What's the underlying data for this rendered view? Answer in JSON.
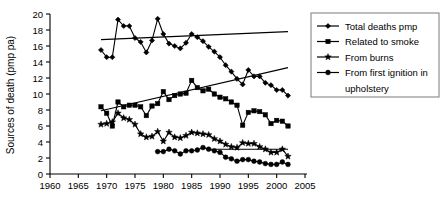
{
  "chart_data": {
    "type": "line",
    "title": "",
    "xlabel": "",
    "ylabel": "Sources of death (pmp pa)",
    "xlim": [
      1960,
      2005
    ],
    "ylim": [
      0,
      20
    ],
    "xticks": [
      1960,
      1965,
      1970,
      1975,
      1980,
      1985,
      1990,
      1995,
      2000,
      2005
    ],
    "yticks": [
      0,
      2,
      4,
      6,
      8,
      10,
      12,
      14,
      16,
      18,
      20
    ],
    "grid": false,
    "legend_position": "right",
    "series": [
      {
        "name": "Total deaths pmp",
        "marker": "diamond",
        "x": [
          1969,
          1970,
          1971,
          1972,
          1973,
          1974,
          1975,
          1976,
          1977,
          1978,
          1979,
          1980,
          1981,
          1982,
          1983,
          1984,
          1985,
          1986,
          1987,
          1988,
          1989,
          1990,
          1991,
          1992,
          1993,
          1994,
          1995,
          1996,
          1997,
          1998,
          1999,
          2000,
          2001,
          2002
        ],
        "values": [
          15.5,
          14.6,
          14.6,
          19.3,
          18.5,
          18.5,
          17.0,
          16.5,
          15.2,
          16.7,
          19.4,
          17.5,
          16.3,
          16.0,
          15.7,
          16.4,
          17.5,
          17.1,
          16.6,
          15.9,
          15.3,
          14.6,
          13.6,
          12.8,
          11.9,
          11.2,
          13.0,
          12.2,
          12.2,
          11.4,
          11.1,
          10.5,
          10.5,
          9.8
        ]
      },
      {
        "name": "Related to smoke",
        "marker": "square",
        "x": [
          1969,
          1970,
          1971,
          1972,
          1973,
          1974,
          1975,
          1976,
          1977,
          1978,
          1979,
          1980,
          1981,
          1982,
          1983,
          1984,
          1985,
          1986,
          1987,
          1988,
          1989,
          1990,
          1991,
          1992,
          1993,
          1994,
          1995,
          1996,
          1997,
          1998,
          1999,
          2000,
          2001,
          2002
        ],
        "values": [
          8.4,
          7.6,
          6.0,
          9.0,
          8.4,
          8.6,
          8.6,
          8.4,
          7.3,
          8.5,
          8.8,
          10.3,
          9.3,
          9.8,
          10.0,
          10.1,
          11.7,
          10.8,
          10.4,
          10.6,
          10.0,
          9.6,
          9.4,
          9.0,
          8.6,
          6.1,
          7.7,
          7.9,
          7.8,
          7.4,
          6.3,
          6.7,
          6.6,
          6.0
        ]
      },
      {
        "name": "From burns",
        "marker": "star",
        "x": [
          1969,
          1970,
          1971,
          1972,
          1973,
          1974,
          1975,
          1976,
          1977,
          1978,
          1979,
          1980,
          1981,
          1982,
          1983,
          1984,
          1985,
          1986,
          1987,
          1988,
          1989,
          1990,
          1991,
          1992,
          1993,
          1994,
          1995,
          1996,
          1997,
          1998,
          1999,
          2000,
          2001,
          2002
        ],
        "values": [
          6.2,
          6.3,
          6.5,
          7.6,
          7.0,
          6.8,
          6.2,
          5.0,
          4.6,
          4.7,
          5.3,
          4.1,
          5.2,
          4.6,
          4.5,
          4.8,
          5.2,
          5.1,
          5.0,
          4.9,
          4.4,
          4.1,
          3.7,
          3.4,
          3.3,
          3.9,
          3.8,
          3.8,
          3.4,
          3.1,
          2.7,
          2.7,
          3.1,
          2.2
        ]
      },
      {
        "name": "From first ignition in upholstery",
        "marker": "circle",
        "x": [
          1979,
          1980,
          1981,
          1982,
          1983,
          1984,
          1985,
          1986,
          1987,
          1988,
          1989,
          1990,
          1991,
          1992,
          1993,
          1994,
          1995,
          1996,
          1997,
          1998,
          1999,
          2000,
          2001,
          2002
        ],
        "values": [
          2.8,
          2.8,
          3.1,
          2.9,
          2.5,
          2.9,
          2.9,
          3.0,
          3.3,
          3.1,
          2.9,
          2.7,
          2.1,
          1.9,
          1.6,
          1.8,
          1.8,
          1.6,
          1.5,
          1.3,
          1.2,
          1.2,
          1.5,
          1.2
        ]
      }
    ],
    "trendlines": [
      {
        "name": "total-deaths-trend",
        "x": [
          1969,
          2002
        ],
        "y": [
          16.8,
          17.8
        ]
      },
      {
        "name": "related-to-smoke-trend",
        "x": [
          1969,
          2002
        ],
        "y": [
          7.9,
          13.3
        ]
      },
      {
        "name": "from-burns-trend",
        "x": [
          1988,
          2002
        ],
        "y": [
          3.1,
          3.1
        ]
      }
    ]
  },
  "legend": {
    "items": [
      {
        "label": "Total deaths pmp",
        "marker": "diamond"
      },
      {
        "label": "Related to smoke",
        "marker": "square"
      },
      {
        "label": "From burns",
        "marker": "star"
      },
      {
        "label": "From first ignition in",
        "marker": "circle"
      },
      {
        "label": "upholstery",
        "marker": "none"
      }
    ]
  }
}
